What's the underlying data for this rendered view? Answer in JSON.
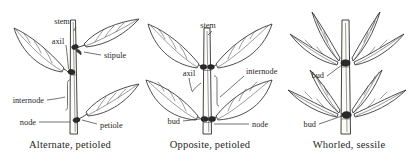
{
  "figure": {
    "background_color": "#ffffff",
    "line_color": "#2e2e2e",
    "text_color": "#1f1f1f"
  },
  "panels": [
    {
      "id": "alternate",
      "caption": "Alternate, petioled",
      "arrangement": "alternate",
      "leaf_shape": "ovate",
      "leaf_count": 3,
      "labels": [
        {
          "text": "stem",
          "x": 62,
          "y": 22
        },
        {
          "text": "axil",
          "x": 56,
          "y": 42
        },
        {
          "text": "stipule",
          "x": 104,
          "y": 57
        },
        {
          "text": "internode",
          "x": 10,
          "y": 102
        },
        {
          "text": "node",
          "x": 22,
          "y": 124
        },
        {
          "text": "petiole",
          "x": 100,
          "y": 126
        }
      ]
    },
    {
      "id": "opposite",
      "caption": "Opposite, petioled",
      "arrangement": "opposite",
      "leaf_shape": "ovate",
      "leaf_count": 4,
      "labels": [
        {
          "text": "stem",
          "x": 68,
          "y": 24
        },
        {
          "text": "axil",
          "x": 50,
          "y": 74
        },
        {
          "text": "internode",
          "x": 108,
          "y": 70
        },
        {
          "text": "bud",
          "x": 30,
          "y": 125
        },
        {
          "text": "node",
          "x": 112,
          "y": 126
        }
      ]
    },
    {
      "id": "whorled",
      "caption": "Whorled, sessile",
      "arrangement": "whorled",
      "leaf_shape": "lanceolate",
      "leaf_count": 8,
      "labels": [
        {
          "text": "bud",
          "x": 32,
          "y": 76
        },
        {
          "text": "bud",
          "x": 24,
          "y": 125
        }
      ]
    }
  ],
  "terms": [
    "stem",
    "axil",
    "stipule",
    "internode",
    "node",
    "petiole",
    "bud"
  ]
}
